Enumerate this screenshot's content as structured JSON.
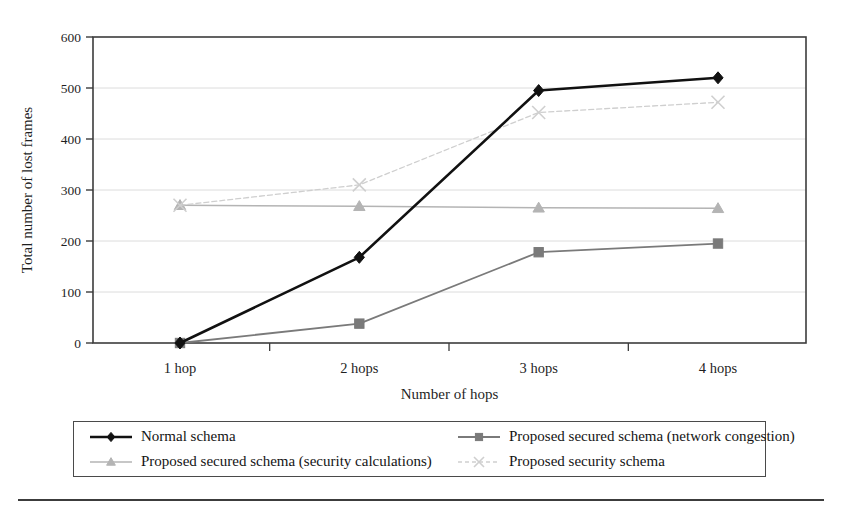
{
  "figure": {
    "background_color": "#ffffff",
    "frame_color": "#3c3c3c"
  },
  "chart_data": {
    "type": "line",
    "title": "",
    "xlabel": "Number of hops",
    "ylabel": "Total number of lost frames",
    "categories": [
      "1 hop",
      "2 hops",
      "3 hops",
      "4 hops"
    ],
    "yticks": [
      0,
      100,
      200,
      300,
      400,
      500,
      600
    ],
    "ylim": [
      0,
      600
    ],
    "grid": true,
    "grid_axis": "y",
    "legend_position": "bottom",
    "series": [
      {
        "name": "Normal schema",
        "values": [
          0,
          168,
          495,
          520
        ],
        "color": "#111111",
        "marker": "diamond",
        "line_width": 2.6,
        "line_style": "solid"
      },
      {
        "name": "Proposed secured schema (network congestion)",
        "values": [
          0,
          38,
          178,
          195
        ],
        "color": "#7a7a7a",
        "marker": "square",
        "line_width": 1.8,
        "line_style": "solid"
      },
      {
        "name": "Proposed secured schema (security calculations)",
        "values": [
          270,
          268,
          265,
          264
        ],
        "color": "#b4b4b4",
        "marker": "triangle",
        "line_width": 1.5,
        "line_style": "solid"
      },
      {
        "name": "Proposed security schema",
        "values": [
          270,
          310,
          452,
          472
        ],
        "color": "#cfcfcf",
        "marker": "x",
        "line_width": 1.3,
        "line_style": "dashed"
      }
    ]
  }
}
